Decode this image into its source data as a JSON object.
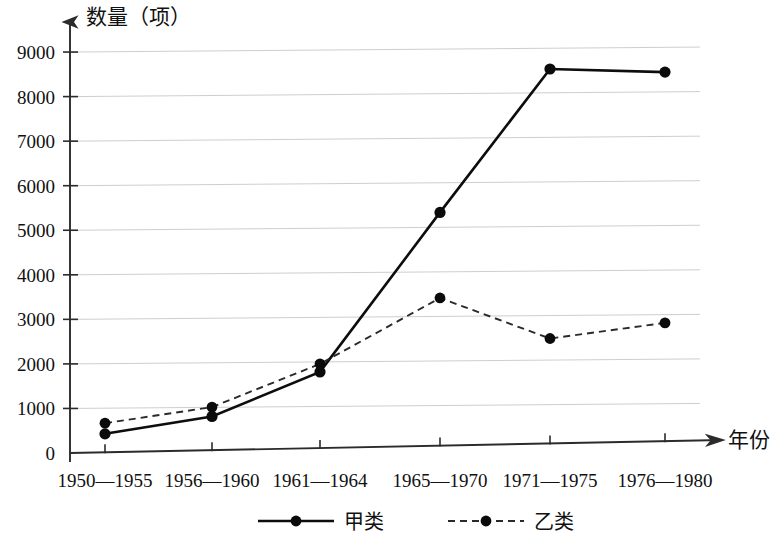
{
  "chart_data": {
    "type": "line",
    "title": "",
    "ylabel": "数量（项）",
    "xlabel": "年份",
    "categories": [
      "1950—1955",
      "1956—1960",
      "1961—1964",
      "1965—1970",
      "1971—1975",
      "1976—1980"
    ],
    "series": [
      {
        "name": "甲类",
        "style": "solid",
        "marker": "circle",
        "color": "#0d0d0d",
        "values": [
          430,
          820,
          1820,
          5400,
          8620,
          8550
        ]
      },
      {
        "name": "乙类",
        "style": "dashed",
        "marker": "circle",
        "color": "#2a2a2a",
        "values": [
          670,
          1030,
          2000,
          3480,
          2570,
          2920
        ]
      }
    ],
    "ylim": [
      0,
      9400
    ],
    "yticks": [
      0,
      1000,
      2000,
      3000,
      4000,
      5000,
      6000,
      7000,
      8000,
      9000
    ],
    "ytick_labels": [
      "0",
      "1000",
      "2000",
      "3000",
      "4000",
      "5000",
      "6000",
      "7000",
      "8000",
      "9000"
    ],
    "grid": true,
    "grid_axis": "y",
    "legend_position": "bottom",
    "legend": [
      {
        "label": "甲类",
        "style": "solid"
      },
      {
        "label": "乙类",
        "style": "dashed"
      }
    ],
    "axis_arrows": {
      "x": true,
      "y": true
    }
  }
}
